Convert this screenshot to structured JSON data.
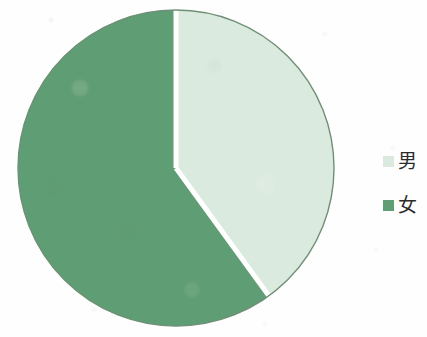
{
  "figure": {
    "background_color": "#fefefe"
  },
  "legend": {
    "position": "right",
    "items": [
      {
        "label": "男",
        "color": "#dbeade",
        "swatch_name": "legend-swatch-male"
      },
      {
        "label": "女",
        "color": "#5f9d74",
        "swatch_name": "legend-swatch-female"
      }
    ]
  },
  "chart_data": {
    "type": "pie",
    "title": "",
    "subtitle": "",
    "xlabel": "",
    "ylabel": "",
    "grid": false,
    "legend_position": "right",
    "start_angle_deg": 0,
    "direction": "clockwise",
    "center": {
      "x": 160,
      "y": 160
    },
    "radius": 158,
    "separator_color": "#ffffff",
    "separator_width": 5,
    "outline_color": "#6f8f76",
    "labels": [
      "男",
      "女"
    ],
    "colors": [
      "#dbeade",
      "#5f9d74"
    ],
    "values": [
      40,
      60
    ],
    "slices": [
      {
        "label": "男",
        "value": 40,
        "percent": 40,
        "color": "#dbeade",
        "start_angle_deg": 0,
        "end_angle_deg": 144
      },
      {
        "label": "女",
        "value": 60,
        "percent": 60,
        "color": "#5f9d74",
        "start_angle_deg": 144,
        "end_angle_deg": 360
      }
    ]
  }
}
